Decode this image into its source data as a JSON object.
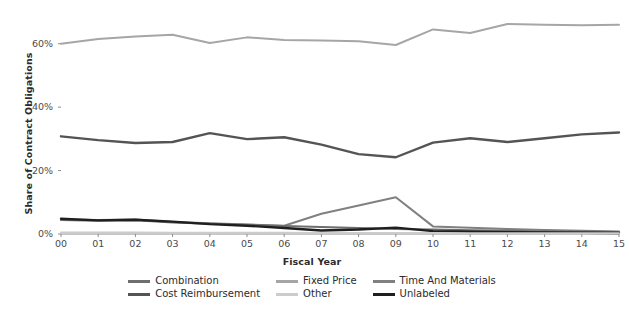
{
  "chart_data": {
    "type": "line",
    "title": "",
    "xlabel": "Fiscal Year",
    "ylabel": "Share of Contract Obligations",
    "categories": [
      "00",
      "01",
      "02",
      "03",
      "04",
      "05",
      "06",
      "07",
      "08",
      "09",
      "10",
      "11",
      "12",
      "13",
      "14",
      "15"
    ],
    "xlim": [
      0,
      15
    ],
    "ylim": [
      0,
      70
    ],
    "grid": false,
    "legend_position": "bottom",
    "ytick_labels": [
      "0%",
      "20%",
      "40%",
      "60%"
    ],
    "ytick_values": [
      0,
      20,
      40,
      60
    ],
    "series": [
      {
        "name": "Fixed Price",
        "color": "#a6a6a6",
        "width": 2.0,
        "values": [
          60.0,
          61.5,
          62.3,
          62.8,
          60.2,
          62.0,
          61.2,
          61.0,
          60.8,
          59.6,
          64.5,
          63.4,
          66.2,
          66.0,
          65.8,
          66.0
        ]
      },
      {
        "name": "Cost Reimbursement",
        "color": "#545454",
        "width": 2.4,
        "values": [
          30.8,
          29.6,
          28.7,
          29.0,
          31.8,
          29.9,
          30.5,
          28.2,
          25.2,
          24.2,
          28.8,
          30.2,
          29.0,
          30.2,
          31.4,
          32.0
        ]
      },
      {
        "name": "Time And Materials",
        "color": "#808080",
        "width": 2.0,
        "values": [
          4.6,
          4.4,
          4.6,
          3.8,
          3.4,
          3.0,
          2.6,
          6.4,
          9.0,
          11.6,
          2.4,
          2.0,
          1.6,
          1.3,
          1.0,
          0.8
        ]
      },
      {
        "name": "Combination",
        "color": "#6e6e6e",
        "width": 2.0,
        "values": [
          4.4,
          4.2,
          4.3,
          3.6,
          3.2,
          2.9,
          2.5,
          2.2,
          1.9,
          1.6,
          1.4,
          1.2,
          1.0,
          0.8,
          0.7,
          0.6
        ]
      },
      {
        "name": "Unlabeled",
        "color": "#1f1f1f",
        "width": 2.4,
        "values": [
          4.8,
          4.3,
          4.5,
          3.9,
          3.1,
          2.6,
          1.9,
          1.1,
          1.4,
          2.0,
          0.9,
          0.7,
          0.6,
          0.5,
          0.4,
          0.3
        ]
      },
      {
        "name": "Other",
        "color": "#cccccc",
        "width": 2.0,
        "values": [
          0.5,
          0.5,
          0.5,
          0.4,
          0.4,
          0.4,
          0.4,
          0.3,
          0.3,
          0.3,
          0.3,
          0.2,
          0.2,
          0.2,
          0.2,
          0.2
        ]
      }
    ]
  },
  "legend": {
    "entries": [
      {
        "label": "Combination",
        "color": "#6e6e6e"
      },
      {
        "label": "Cost Reimbursement",
        "color": "#545454"
      },
      {
        "label": "Fixed Price",
        "color": "#a6a6a6"
      },
      {
        "label": "Other",
        "color": "#cccccc"
      },
      {
        "label": "Time And Materials",
        "color": "#808080"
      },
      {
        "label": "Unlabeled",
        "color": "#1f1f1f"
      }
    ]
  },
  "axes": {
    "x_title": "Fiscal Year",
    "y_title": "Share of Contract Obligations"
  }
}
